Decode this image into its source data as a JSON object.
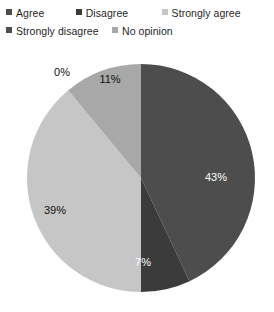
{
  "legend": {
    "rows": [
      [
        {
          "label": "Agree",
          "color": "#4d4d4d",
          "icon": "square-swatch-icon"
        },
        {
          "label": "Disagree",
          "color": "#3b3b3b",
          "icon": "square-swatch-icon"
        },
        {
          "label": "Strongly agree",
          "color": "#c6c6c6",
          "icon": "square-swatch-icon"
        }
      ],
      [
        {
          "label": "Strongly disagree",
          "color": "#4d4d4d",
          "icon": "square-swatch-icon"
        },
        {
          "label": "No opinion",
          "color": "#a8a8a8",
          "icon": "square-swatch-icon"
        }
      ]
    ]
  },
  "chart_data": {
    "type": "pie",
    "title": "",
    "legend_position": "top",
    "start_angle_deg": 0,
    "direction": "clockwise",
    "categories": [
      "Agree",
      "Disagree",
      "Strongly agree",
      "Strongly disagree",
      "No opinion"
    ],
    "values": [
      43,
      7,
      39,
      0,
      11
    ],
    "labels": [
      "43%",
      "7%",
      "39%",
      "0%",
      "11%"
    ],
    "colors": [
      "#4d4d4d",
      "#3b3b3b",
      "#c6c6c6",
      "#cccccc",
      "#a8a8a8"
    ],
    "label_colors": [
      "#ffffff",
      "#ffffff",
      "#101010",
      "#101010",
      "#101010"
    ],
    "units": "percent",
    "total": 100
  },
  "slice_labels": {
    "agree": "43%",
    "disagree": "7%",
    "strongly_agree": "39%",
    "strongly_disagree": "0%",
    "no_opinion": "11%"
  }
}
